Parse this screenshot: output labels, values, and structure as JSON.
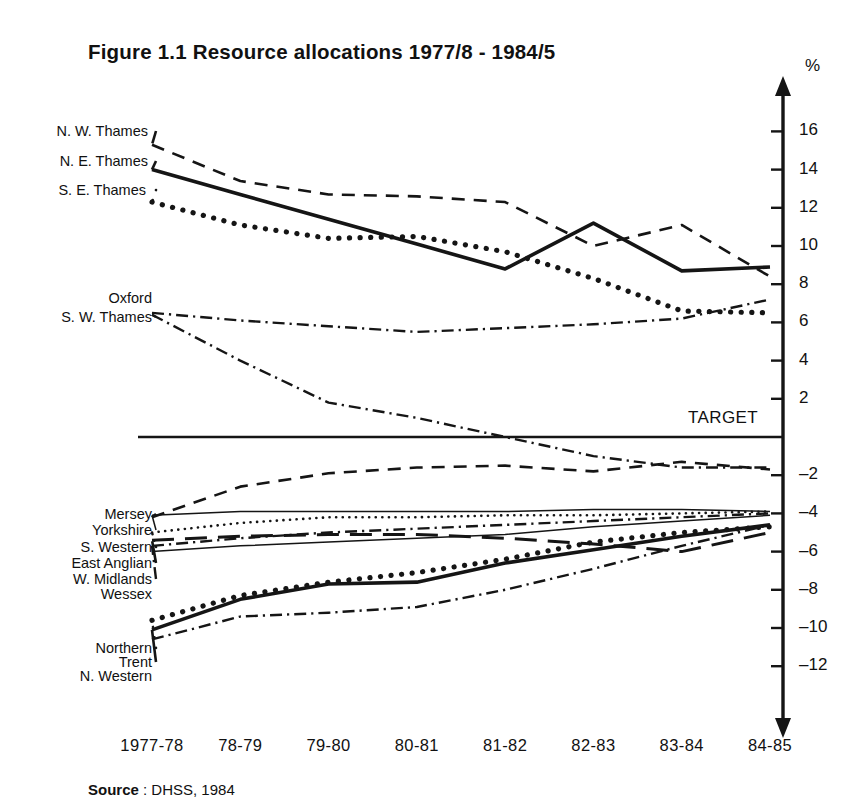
{
  "title": "Figure 1.1  Resource allocations 1977/8 - 1984/5",
  "source": {
    "key": "Source",
    "value": " : DHSS, 1984"
  },
  "axis": {
    "unit": "%",
    "target_label": "TARGET",
    "y_ticks": [
      "16",
      "14",
      "12",
      "10",
      "8",
      "6",
      "4",
      "2",
      "-2",
      "-4",
      "-6",
      "-8",
      "-10",
      "-12"
    ],
    "x_ticks": [
      "1977-78",
      "78-79",
      "79-80",
      "80-81",
      "81-82",
      "82-83",
      "83-84",
      "84-85"
    ]
  },
  "series_labels": [
    "N. W. Thames",
    "N. E. Thames",
    "S. E. Thames",
    "Oxford",
    "S. W. Thames",
    "Mersey",
    "Yorkshire",
    "S. Western",
    "East Anglian",
    "W. Midlands",
    "Wessex",
    "Northern",
    "Trent",
    "N. Western"
  ],
  "chart_data": {
    "type": "line",
    "title": "Figure 1.1  Resource allocations 1977/8 - 1984/5",
    "subtitle": "",
    "xlabel": "",
    "ylabel": "%",
    "ylim": [
      -13,
      17
    ],
    "grid": false,
    "legend_position": "left-inline",
    "annotations": [
      {
        "text": "TARGET",
        "x": "83-84",
        "y": 0.8
      },
      {
        "text": "Source : DHSS, 1984",
        "x": "",
        "y": 0
      }
    ],
    "reference_lines": [
      {
        "label": "TARGET",
        "value": 0,
        "style": "solid"
      }
    ],
    "categories": [
      "1977-78",
      "78-79",
      "79-80",
      "80-81",
      "81-82",
      "82-83",
      "83-84",
      "84-85"
    ],
    "series": [
      {
        "name": "N. W. Thames",
        "style": "dashed",
        "values": [
          15.3,
          13.4,
          12.7,
          12.6,
          12.3,
          10.0,
          11.1,
          8.4
        ]
      },
      {
        "name": "N. E. Thames",
        "style": "solid-thick",
        "values": [
          14.0,
          12.7,
          11.4,
          10.1,
          8.8,
          11.2,
          8.7,
          8.9
        ]
      },
      {
        "name": "S. E. Thames",
        "style": "dotted-thick",
        "values": [
          12.3,
          11.1,
          10.4,
          10.5,
          9.7,
          8.3,
          6.6,
          6.5
        ]
      },
      {
        "name": "Oxford",
        "style": "dash-dot",
        "values": [
          6.5,
          6.1,
          5.8,
          5.5,
          5.7,
          5.9,
          6.2,
          7.2
        ]
      },
      {
        "name": "S. W. Thames",
        "style": "dash-dot",
        "values": [
          6.4,
          4.0,
          1.8,
          1.0,
          0.0,
          -1.0,
          -1.6,
          -1.6
        ]
      },
      {
        "name": "Mersey",
        "style": "dashed",
        "values": [
          -4.2,
          -2.6,
          -1.9,
          -1.6,
          -1.5,
          -1.8,
          -1.3,
          -1.7
        ]
      },
      {
        "name": "Yorkshire",
        "style": "solid-thin",
        "values": [
          -4.1,
          -3.9,
          -3.9,
          -3.9,
          -3.9,
          -3.8,
          -3.8,
          -3.9
        ]
      },
      {
        "name": "S. Western",
        "style": "dotted-thin",
        "values": [
          -5.0,
          -4.5,
          -4.2,
          -4.2,
          -4.1,
          -4.1,
          -4.0,
          -3.9
        ]
      },
      {
        "name": "East Anglian",
        "style": "dash-long",
        "values": [
          -5.4,
          -5.2,
          -5.1,
          -5.1,
          -5.3,
          -5.6,
          -6.0,
          -5.0
        ]
      },
      {
        "name": "W. Midlands",
        "style": "dash-dot",
        "values": [
          -5.7,
          -5.3,
          -5.0,
          -4.8,
          -4.6,
          -4.4,
          -4.2,
          -4.0
        ]
      },
      {
        "name": "Wessex",
        "style": "solid-thin",
        "values": [
          -6.0,
          -5.7,
          -5.5,
          -5.3,
          -5.1,
          -4.7,
          -4.4,
          -4.1
        ]
      },
      {
        "name": "Northern",
        "style": "dotted-thick",
        "values": [
          -9.6,
          -8.3,
          -7.6,
          -7.1,
          -6.4,
          -5.5,
          -5.0,
          -4.7
        ]
      },
      {
        "name": "Trent",
        "style": "solid-thick",
        "values": [
          -10.1,
          -8.5,
          -7.7,
          -7.6,
          -6.6,
          -5.9,
          -5.2,
          -4.6
        ]
      },
      {
        "name": "N. Western",
        "style": "dash-dot",
        "values": [
          -10.6,
          -9.4,
          -9.2,
          -8.9,
          -8.0,
          -6.9,
          -5.7,
          -4.6
        ]
      }
    ]
  }
}
